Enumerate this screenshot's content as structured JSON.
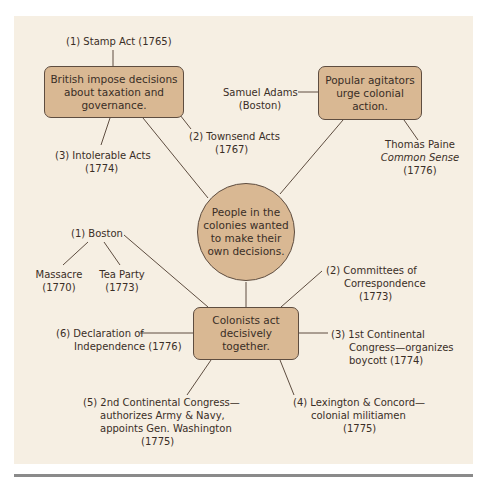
{
  "central_node": {
    "text_lines": [
      "People in the",
      "colonies wanted",
      "to make their",
      "own decisions."
    ]
  },
  "british_node": {
    "text_lines": [
      "British impose decisions",
      "about taxation and",
      "governance."
    ],
    "events": [
      {
        "num": "(1)",
        "lines": [
          "Stamp Act (1765)"
        ]
      },
      {
        "num": "(2)",
        "lines": [
          "Townsend Acts",
          "(1767)"
        ]
      },
      {
        "num": "(3)",
        "lines": [
          "Intolerable Acts",
          "(1774)"
        ]
      }
    ]
  },
  "agitators_node": {
    "text_lines": [
      "Popular agitators",
      "urge colonial",
      "action."
    ],
    "people": [
      {
        "lines": [
          "Samuel Adams",
          "(Boston)"
        ]
      },
      {
        "lines": [
          "Thomas Paine",
          "Common Sense",
          "(1776)"
        ]
      }
    ]
  },
  "colonists_node": {
    "text_lines": [
      "Colonists act",
      "decisively",
      "together."
    ],
    "events": [
      {
        "num": "(1)",
        "lines": [
          "Boston"
        ],
        "sub": [
          {
            "lines": [
              "Massacre",
              "(1770)"
            ]
          },
          {
            "lines": [
              "Tea Party",
              "(1773)"
            ]
          }
        ]
      },
      {
        "num": "(2)",
        "lines": [
          "Committees of",
          "Correspondence",
          "(1773)"
        ]
      },
      {
        "num": "(3)",
        "lines": [
          "1st Continental",
          "Congress—organizes",
          "boycott (1774)"
        ]
      },
      {
        "num": "(4)",
        "lines": [
          "Lexington & Concord—",
          "colonial militiamen",
          "(1775)"
        ]
      },
      {
        "num": "(5)",
        "lines": [
          "2nd Continental Congress—",
          "authorizes Army & Navy,",
          "appoints Gen. Washington",
          "(1775)"
        ]
      },
      {
        "num": "(6)",
        "lines": [
          "Declaration of",
          "Independence (1776)"
        ]
      }
    ]
  },
  "colors": {
    "panel_bg": "#f6efe3",
    "node_fill": "#d9b893",
    "node_border": "#5e4d40",
    "line": "#5e4d40",
    "rule": "#8a8a8a"
  }
}
